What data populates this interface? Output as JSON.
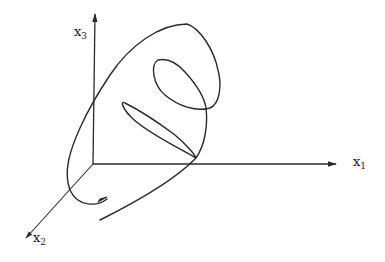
{
  "figure": {
    "stroke_color": "#2a2a2a",
    "axes": {
      "x1": {
        "label": "x",
        "subscript": "1"
      },
      "x2": {
        "label": "x",
        "subscript": "2"
      },
      "x3": {
        "label": "x",
        "subscript": "3"
      }
    }
  }
}
